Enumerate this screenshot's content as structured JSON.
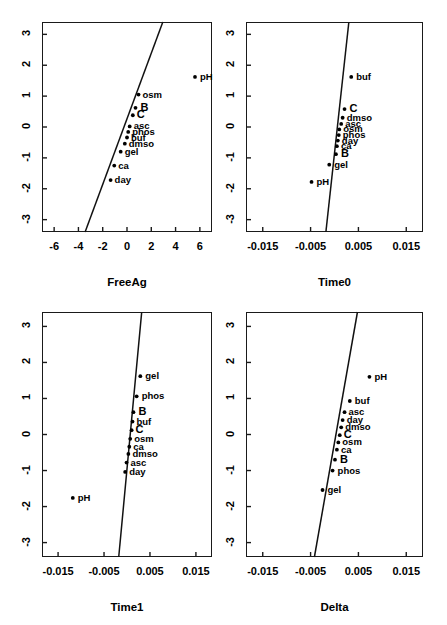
{
  "figure": {
    "type": "scatter-matrix",
    "panel_count": 4,
    "layout": "2x2"
  },
  "chart_data": [
    {
      "type": "scatter",
      "title": "",
      "xlabel": "FreeAg",
      "ylabel": "",
      "xlim": [
        -7.0,
        7.0
      ],
      "ylim": [
        -3.4,
        3.4
      ],
      "xticks": [
        "-6",
        "-4",
        "-2",
        "0",
        "2",
        "4",
        "6"
      ],
      "xtickvals": [
        -6,
        -4,
        -2,
        0,
        2,
        4,
        6
      ],
      "yticks": [
        "-3",
        "-2",
        "-1",
        "0",
        "1",
        "2",
        "3"
      ],
      "ytickvals": [
        -3,
        -2,
        -1,
        0,
        1,
        2,
        3
      ],
      "grid": false,
      "legend": "none",
      "points": [
        {
          "label": "pH",
          "x": 5.6,
          "y": 1.62
        },
        {
          "label": "osm",
          "x": 0.95,
          "y": 1.05
        },
        {
          "label": "B",
          "x": 0.7,
          "y": 0.62
        },
        {
          "label": "C",
          "x": 0.48,
          "y": 0.38
        },
        {
          "label": "asc",
          "x": 0.22,
          "y": 0.02
        },
        {
          "label": "phos",
          "x": 0.1,
          "y": -0.16
        },
        {
          "label": "buf",
          "x": 0.0,
          "y": -0.34
        },
        {
          "label": "dmso",
          "x": -0.18,
          "y": -0.54
        },
        {
          "label": "gel",
          "x": -0.52,
          "y": -0.8
        },
        {
          "label": "ca",
          "x": -1.05,
          "y": -1.25
        },
        {
          "label": "day",
          "x": -1.35,
          "y": -1.72
        }
      ],
      "line": {
        "x0": -3.45,
        "y0": -3.4,
        "x1": 2.95,
        "y1": 3.4
      }
    },
    {
      "type": "scatter",
      "title": "",
      "xlabel": "Time0",
      "ylabel": "",
      "xlim": [
        -0.0185,
        0.0185
      ],
      "ylim": [
        -3.4,
        3.4
      ],
      "xticks": [
        "-0.015",
        "-0.005",
        "0.005",
        "0.015"
      ],
      "xtickvals": [
        -0.015,
        -0.005,
        0.005,
        0.015
      ],
      "yticks": [
        "-3",
        "-2",
        "-1",
        "0",
        "1",
        "2",
        "3"
      ],
      "ytickvals": [
        -3,
        -2,
        -1,
        0,
        1,
        2,
        3
      ],
      "grid": false,
      "legend": "none",
      "points": [
        {
          "label": "buf",
          "x": 0.0035,
          "y": 1.62
        },
        {
          "label": "C",
          "x": 0.0021,
          "y": 0.58
        },
        {
          "label": "dmso",
          "x": 0.0017,
          "y": 0.3
        },
        {
          "label": "asc",
          "x": 0.0014,
          "y": 0.1
        },
        {
          "label": "osm",
          "x": 0.001,
          "y": -0.08
        },
        {
          "label": "phos",
          "x": 0.0009,
          "y": -0.26
        },
        {
          "label": "day",
          "x": 0.0007,
          "y": -0.44
        },
        {
          "label": "ca",
          "x": 0.0005,
          "y": -0.62
        },
        {
          "label": "B",
          "x": 0.0003,
          "y": -0.88
        },
        {
          "label": "gel",
          "x": -0.0011,
          "y": -1.22
        },
        {
          "label": "pH",
          "x": -0.0048,
          "y": -1.78
        }
      ],
      "line": {
        "x0": -0.0018,
        "y0": -3.4,
        "x1": 0.003,
        "y1": 3.4
      }
    },
    {
      "type": "scatter",
      "title": "",
      "xlabel": "Time1",
      "ylabel": "",
      "xlim": [
        -0.0185,
        0.0185
      ],
      "ylim": [
        -3.4,
        3.4
      ],
      "xticks": [
        "-0.015",
        "-0.005",
        "0.005",
        "0.015"
      ],
      "xtickvals": [
        -0.015,
        -0.005,
        0.005,
        0.015
      ],
      "yticks": [
        "-3",
        "-2",
        "-1",
        "0",
        "1",
        "2",
        "3"
      ],
      "ytickvals": [
        -3,
        -2,
        -1,
        0,
        1,
        2,
        3
      ],
      "grid": false,
      "legend": "none",
      "points": [
        {
          "label": "gel",
          "x": 0.0029,
          "y": 1.62
        },
        {
          "label": "phos",
          "x": 0.0021,
          "y": 1.06
        },
        {
          "label": "B",
          "x": 0.0014,
          "y": 0.62
        },
        {
          "label": "buf",
          "x": 0.0012,
          "y": 0.36
        },
        {
          "label": "C",
          "x": 0.001,
          "y": 0.12
        },
        {
          "label": "osm",
          "x": 0.0007,
          "y": -0.12
        },
        {
          "label": "ca",
          "x": 0.0005,
          "y": -0.34
        },
        {
          "label": "dmso",
          "x": 0.0003,
          "y": -0.54
        },
        {
          "label": "asc",
          "x": -0.0001,
          "y": -0.78
        },
        {
          "label": "day",
          "x": -0.0004,
          "y": -1.04
        },
        {
          "label": "pH",
          "x": -0.0118,
          "y": -1.76
        }
      ],
      "line": {
        "x0": -0.0018,
        "y0": -3.4,
        "x1": 0.0032,
        "y1": 3.4
      }
    },
    {
      "type": "scatter",
      "title": "",
      "xlabel": "Delta",
      "ylabel": "",
      "xlim": [
        -0.0185,
        0.0185
      ],
      "ylim": [
        -3.4,
        3.4
      ],
      "xticks": [
        "-0.015",
        "-0.005",
        "0.005",
        "0.015"
      ],
      "xtickvals": [
        -0.015,
        -0.005,
        0.005,
        0.015
      ],
      "yticks": [
        "-3",
        "-2",
        "-1",
        "0",
        "1",
        "2",
        "3"
      ],
      "ytickvals": [
        -3,
        -2,
        -1,
        0,
        1,
        2,
        3
      ],
      "grid": false,
      "legend": "none",
      "points": [
        {
          "label": "pH",
          "x": 0.0073,
          "y": 1.6
        },
        {
          "label": "buf",
          "x": 0.0032,
          "y": 0.93
        },
        {
          "label": "asc",
          "x": 0.0021,
          "y": 0.62
        },
        {
          "label": "day",
          "x": 0.0017,
          "y": 0.4
        },
        {
          "label": "dmso",
          "x": 0.0014,
          "y": 0.2
        },
        {
          "label": "C",
          "x": 0.0011,
          "y": -0.02
        },
        {
          "label": "osm",
          "x": 0.0008,
          "y": -0.22
        },
        {
          "label": "ca",
          "x": 0.0005,
          "y": -0.42
        },
        {
          "label": "B",
          "x": 0.0001,
          "y": -0.7
        },
        {
          "label": "phos",
          "x": -0.0004,
          "y": -1.0
        },
        {
          "label": "gel",
          "x": -0.0025,
          "y": -1.54
        }
      ],
      "line": {
        "x0": -0.0042,
        "y0": -3.4,
        "x1": 0.0048,
        "y1": 3.4
      }
    }
  ]
}
